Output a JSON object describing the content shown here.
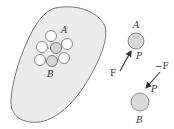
{
  "diagram": {
    "body": {
      "fill": "#ececec",
      "stroke": "#555555"
    },
    "cluster": {
      "particle_fill": "#ffffff",
      "highlight_fill": "#d2d2d2",
      "label_A": "A",
      "label_B": "B"
    },
    "fbd_A": {
      "label": "A",
      "point_label": "P",
      "force_label": "F"
    },
    "fbd_B": {
      "label": "B",
      "point_label": "P",
      "force_label": "−F"
    },
    "colors": {
      "particle_gray": "#d9d9d9",
      "arrow": "#333333"
    }
  }
}
